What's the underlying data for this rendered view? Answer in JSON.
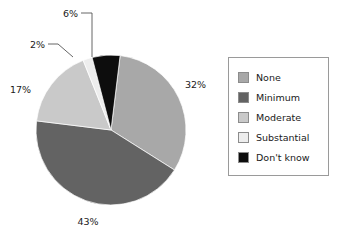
{
  "chart_data": {
    "type": "pie",
    "title": "",
    "subtitle": "",
    "xlabel": "",
    "ylabel": "",
    "legend_position": "right",
    "grid": false,
    "categories": [
      "None",
      "Minimum",
      "Moderate",
      "Substantial",
      "Don't know"
    ],
    "values": [
      32,
      43,
      17,
      2,
      6
    ],
    "value_labels": [
      "32%",
      "43%",
      "17%",
      "2%",
      "6%"
    ],
    "units": "percent",
    "total": 100,
    "colors": [
      "#a8a8a8",
      "#636363",
      "#c9c9c9",
      "#ededed",
      "#0d0d0d"
    ],
    "slices": [
      {
        "label": "None",
        "value": 32,
        "value_label": "32%",
        "color": "#a8a8a8",
        "has_leader_line": false
      },
      {
        "label": "Minimum",
        "value": 43,
        "value_label": "43%",
        "color": "#636363",
        "has_leader_line": false
      },
      {
        "label": "Moderate",
        "value": 17,
        "value_label": "17%",
        "color": "#c9c9c9",
        "has_leader_line": false
      },
      {
        "label": "Substantial",
        "value": 2,
        "value_label": "2%",
        "color": "#ededed",
        "has_leader_line": true
      },
      {
        "label": "Don't know",
        "value": 6,
        "value_label": "6%",
        "color": "#0d0d0d",
        "has_leader_line": true
      }
    ]
  },
  "legend": {
    "items": [
      {
        "label": "None",
        "color": "#a8a8a8"
      },
      {
        "label": "Minimum",
        "color": "#636363"
      },
      {
        "label": "Moderate",
        "color": "#c9c9c9"
      },
      {
        "label": "Substantial",
        "color": "#ededed"
      },
      {
        "label": "Don't know",
        "color": "#0d0d0d"
      }
    ]
  },
  "labels": {
    "none_pct": "32%",
    "minimum_pct": "43%",
    "moderate_pct": "17%",
    "substantial_pct": "2%",
    "dont_know_pct": "6%"
  },
  "geometry": {
    "center_x": 111,
    "center_y": 130,
    "radius": 75,
    "start_angle_deg": -83
  }
}
